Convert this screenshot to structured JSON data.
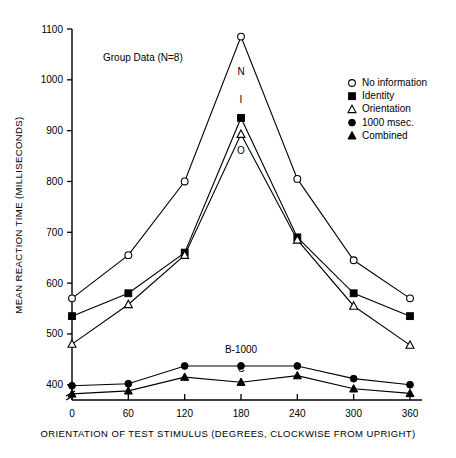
{
  "annotation": {
    "group_note": "Group Data (N=8)"
  },
  "legend": {
    "items": [
      {
        "label": "No information",
        "marker": "open-circle"
      },
      {
        "label": "Identity",
        "marker": "filled-square"
      },
      {
        "label": "Orientation",
        "marker": "open-triangle"
      },
      {
        "label": "1000 msec.",
        "marker": "filled-circle"
      },
      {
        "label": "Combined",
        "marker": "filled-triangle"
      }
    ]
  },
  "curve_labels": [
    {
      "text": "N",
      "x": 180,
      "y": 1010
    },
    {
      "text": "I",
      "x": 180,
      "y": 955
    },
    {
      "text": "O",
      "x": 180,
      "y": 855
    },
    {
      "text": "B-1000",
      "x": 180,
      "y": 462
    },
    {
      "text": "C",
      "x": 180,
      "y": 425
    }
  ],
  "chart_data": {
    "type": "line",
    "title": "",
    "xlabel": "ORIENTATION OF TEST STIMULUS  (DEGREES, CLOCKWISE FROM UPRIGHT)",
    "ylabel": "MEAN REACTION TIME (MILLISECONDS)",
    "x": [
      0,
      60,
      120,
      180,
      240,
      300,
      360
    ],
    "xticklabels": [
      "0",
      "60",
      "120",
      "180",
      "240",
      "300",
      "360"
    ],
    "xlim": [
      0,
      360
    ],
    "ylim": [
      370,
      1100
    ],
    "yticks": [
      400,
      500,
      600,
      700,
      800,
      900,
      1000,
      1100
    ],
    "yticklabels": [
      "400",
      "500",
      "600",
      "700",
      "800",
      "900",
      "1000",
      "1100"
    ],
    "axis_break": true,
    "grid": false,
    "legend_position": "right",
    "series": [
      {
        "name": "No information",
        "marker": "open-circle",
        "values": [
          570,
          655,
          800,
          1085,
          805,
          645,
          570
        ]
      },
      {
        "name": "Identity",
        "marker": "filled-square",
        "values": [
          535,
          580,
          660,
          925,
          690,
          580,
          535
        ]
      },
      {
        "name": "Orientation",
        "marker": "open-triangle",
        "values": [
          480,
          558,
          655,
          893,
          685,
          555,
          478
        ]
      },
      {
        "name": "1000 msec.",
        "marker": "filled-circle",
        "values": [
          398,
          402,
          437,
          437,
          437,
          412,
          400
        ]
      },
      {
        "name": "Combined",
        "marker": "filled-triangle",
        "values": [
          382,
          388,
          415,
          405,
          418,
          392,
          383
        ]
      }
    ]
  }
}
